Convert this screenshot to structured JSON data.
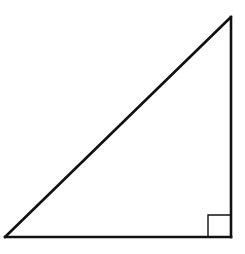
{
  "diagram": {
    "type": "geometry",
    "shape": "right-triangle",
    "vertices": [
      {
        "id": "A",
        "role": "bottom-left acute angle"
      },
      {
        "id": "B",
        "role": "top acute angle"
      },
      {
        "id": "C",
        "role": "right angle"
      }
    ],
    "right_angle_at": "C",
    "right_angle_marker": true,
    "labels": [],
    "colors": {
      "stroke": "#111111",
      "background": "#ffffff"
    }
  }
}
